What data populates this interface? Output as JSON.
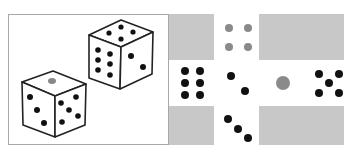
{
  "figure": {
    "left_panel": {
      "description": "Two 3D dice",
      "die_front": {
        "top_face": 1,
        "left_face": 3,
        "right_face": 5,
        "top_pip_color": "#888888"
      },
      "die_back": {
        "top_face": 4,
        "left_face": 6,
        "right_face": 2
      }
    },
    "right_panel": {
      "description": "Unfolded die net (cross layout)",
      "faces": {
        "top": {
          "value": 4,
          "pip_color": "#8a8a8a"
        },
        "left": {
          "value": 6,
          "pip_color": "#111111"
        },
        "center": {
          "value": 2,
          "pip_color": "#111111"
        },
        "right_inner": {
          "value": 1,
          "pip_color": "#8a8a8a"
        },
        "far_right": {
          "value": 5,
          "pip_color": "#111111"
        },
        "bottom": {
          "value": 3,
          "pip_color": "#111111"
        }
      },
      "gray_color": "#c8c8c8"
    }
  }
}
